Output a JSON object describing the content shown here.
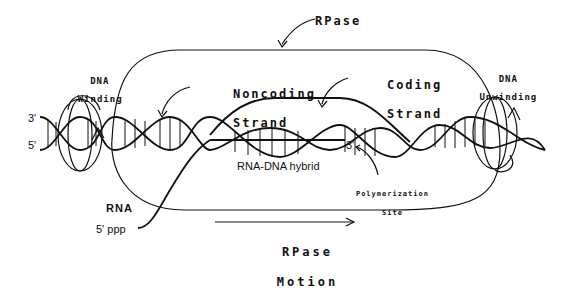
{
  "diagram": {
    "title_labels": {
      "rpase": "RPase",
      "dna_winding_line1": "DNA",
      "dna_winding_line2": "Winding",
      "dna_unwinding_line1": "DNA",
      "dna_unwinding_line2": "Unwinding",
      "noncoding_line1": "Noncoding",
      "noncoding_line2": "Strand",
      "coding_line1": "Coding",
      "coding_line2": "Strand",
      "rna_dna_hybrid": "RNA-DNA hybrid",
      "polymerization_line1": "Polymerization",
      "polymerization_line2": "Site",
      "rna": "RNA",
      "five_ppp": "5' ppp",
      "three_prime_left": "3'",
      "five_prime_left": "5'",
      "three_prime_rna": "3'",
      "motion_line1": "RPase",
      "motion_line2": "Motion"
    },
    "colors": {
      "ink": "#111111",
      "background": "#ffffff"
    }
  }
}
